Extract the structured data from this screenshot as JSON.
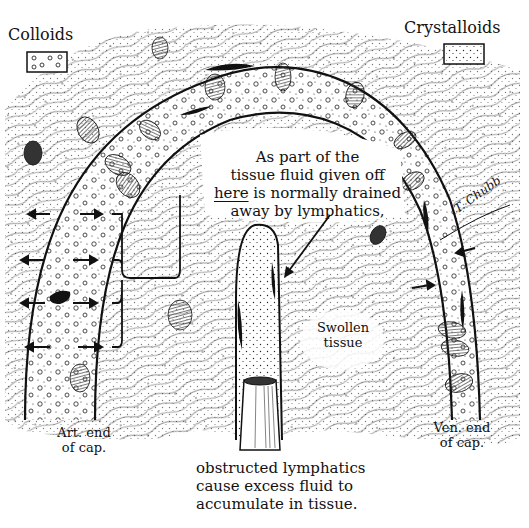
{
  "figure": {
    "style": "hand-drawn black ink medical illustration",
    "colors": {
      "ink": "#111111",
      "background": "#ffffff",
      "hatch": "#333333"
    }
  },
  "legend": {
    "colloids": {
      "label": "Colloids",
      "symbol": "box with small circles"
    },
    "crystalloids": {
      "label": "Crystalloids",
      "symbol": "box with fine dots"
    }
  },
  "annotations": {
    "main_note": {
      "line1": "As part of the",
      "line2": "tissue fluid given off",
      "line3_emph": "here",
      "line3_rest": " is normally drained",
      "line4": "away by lymphatics,"
    },
    "swollen": {
      "line1": "Swollen",
      "line2": "tissue"
    },
    "art_end": {
      "line1": "Art. end",
      "line2": "of cap."
    },
    "ven_end": {
      "line1": "Ven. end",
      "line2": "of cap."
    },
    "bottom_note": {
      "line1": "obstructed lymphatics",
      "line2": "cause excess fluid to",
      "line3": "accumulate in tissue."
    },
    "signature": "T. Chubb"
  },
  "structures": {
    "capillary_loop": "arched capillary from arterial end (left) to venous end (right)",
    "lymphatic_vessel": "blind-ended lymphatic with obstructed (cut) stump",
    "arrows_outflow_left": 4,
    "arrows_inflow_right": 2
  }
}
